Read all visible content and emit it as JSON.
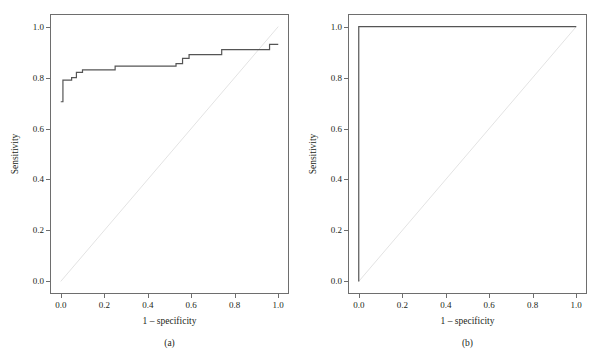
{
  "figure": {
    "width": 614,
    "height": 364,
    "background": "#ffffff",
    "curve_color": "#555555",
    "reference_color": "#e3e3e3",
    "frame_color": "#6e6e6e",
    "text_color": "#231f20"
  },
  "chart_data": [
    {
      "type": "line",
      "panel": "a",
      "caption": "(a)",
      "title": "",
      "xlabel": "1 – specificity",
      "ylabel": "Sensitivity",
      "xlim": [
        0.0,
        1.0
      ],
      "ylim": [
        0.0,
        1.0
      ],
      "xticks": [
        0.0,
        0.2,
        0.4,
        0.6,
        0.8,
        1.0
      ],
      "xtick_labels": [
        "0.0",
        "0.2",
        "0.4",
        "0.6",
        "0.8",
        "1.0"
      ],
      "yticks": [
        0.0,
        0.2,
        0.4,
        0.6,
        0.8,
        1.0
      ],
      "ytick_labels": [
        "0.0",
        "0.2",
        "0.4",
        "0.6",
        "0.8",
        "1.0"
      ],
      "grid": false,
      "legend": null,
      "series": [
        {
          "name": "ROC curve",
          "style": "step",
          "color": "#555555",
          "x": [
            0.0,
            0.01,
            0.01,
            0.05,
            0.05,
            0.072,
            0.072,
            0.1,
            0.1,
            0.25,
            0.25,
            0.53,
            0.53,
            0.56,
            0.56,
            0.59,
            0.59,
            0.74,
            0.74,
            0.96,
            0.96,
            1.0
          ],
          "y": [
            0.705,
            0.705,
            0.79,
            0.79,
            0.8,
            0.8,
            0.82,
            0.82,
            0.83,
            0.83,
            0.845,
            0.845,
            0.855,
            0.855,
            0.875,
            0.875,
            0.89,
            0.89,
            0.91,
            0.91,
            0.93,
            0.93
          ]
        },
        {
          "name": "Reference line",
          "style": "diagonal",
          "color": "#e3e3e3",
          "x": [
            0.0,
            1.0
          ],
          "y": [
            0.0,
            1.0
          ]
        }
      ]
    },
    {
      "type": "line",
      "panel": "b",
      "caption": "(b)",
      "title": "",
      "xlabel": "1 – specificity",
      "ylabel": "Sensitivity",
      "xlim": [
        0.0,
        1.0
      ],
      "ylim": [
        0.0,
        1.0
      ],
      "xticks": [
        0.0,
        0.2,
        0.4,
        0.6,
        0.8,
        1.0
      ],
      "xtick_labels": [
        "0.0",
        "0.2",
        "0.4",
        "0.6",
        "0.8",
        "1.0"
      ],
      "yticks": [
        0.0,
        0.2,
        0.4,
        0.6,
        0.8,
        1.0
      ],
      "ytick_labels": [
        "0.0",
        "0.2",
        "0.4",
        "0.6",
        "0.8",
        "1.0"
      ],
      "grid": false,
      "legend": null,
      "series": [
        {
          "name": "ROC curve",
          "style": "step",
          "color": "#555555",
          "x": [
            0.0,
            0.0,
            1.0
          ],
          "y": [
            0.0,
            1.0,
            1.0
          ]
        },
        {
          "name": "Reference line",
          "style": "diagonal",
          "color": "#e3e3e3",
          "x": [
            0.0,
            1.0
          ],
          "y": [
            0.0,
            1.0
          ]
        }
      ]
    }
  ],
  "panels": [
    {
      "id": "a",
      "caption": "(a)",
      "xlabel": "1 – specificity",
      "ylabel": "Sensitivity",
      "xtick_labels": [
        "0.0",
        "0.2",
        "0.4",
        "0.6",
        "0.8",
        "1.0"
      ],
      "ytick_labels": [
        "0.0",
        "0.2",
        "0.4",
        "0.6",
        "0.8",
        "1.0"
      ]
    },
    {
      "id": "b",
      "caption": "(b)",
      "xlabel": "1 – specificity",
      "ylabel": "Sensitivity",
      "xtick_labels": [
        "0.0",
        "0.2",
        "0.4",
        "0.6",
        "0.8",
        "1.0"
      ],
      "ytick_labels": [
        "0.0",
        "0.2",
        "0.4",
        "0.6",
        "0.8",
        "1.0"
      ]
    }
  ]
}
